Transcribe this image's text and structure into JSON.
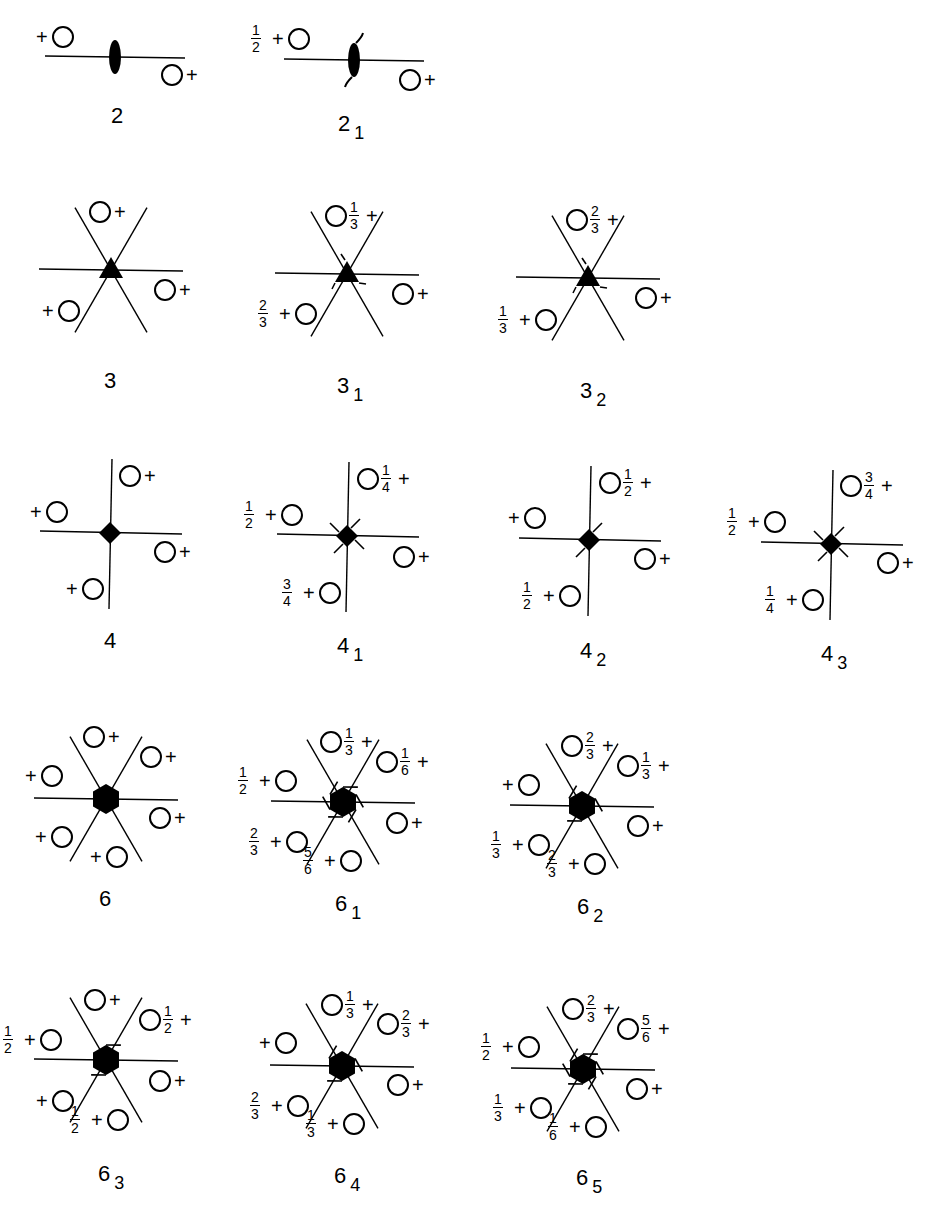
{
  "figure": {
    "panels": [
      {
        "id": "p2",
        "label": "2",
        "sub": "",
        "order": 2,
        "screw": 0,
        "cx": 115,
        "cy": 57,
        "type": "line",
        "positions": [
          {
            "x": 63,
            "y": 37,
            "frac": "",
            "plusSide": "left"
          },
          {
            "x": 172,
            "y": 75,
            "frac": "",
            "plusSide": "right"
          }
        ]
      },
      {
        "id": "p21",
        "label": "2",
        "sub": "1",
        "order": 2,
        "screw": 1,
        "cx": 354,
        "cy": 60,
        "type": "line",
        "positions": [
          {
            "x": 299,
            "y": 39,
            "frac": "1/2",
            "plusSide": "left"
          },
          {
            "x": 410,
            "y": 80,
            "frac": "",
            "plusSide": "right"
          }
        ]
      },
      {
        "id": "p3",
        "label": "3",
        "sub": "",
        "order": 3,
        "screw": 0,
        "cx": 111,
        "cy": 270,
        "positions": [
          {
            "x": 100,
            "y": 212,
            "frac": "",
            "plusSide": "right"
          },
          {
            "x": 165,
            "y": 290,
            "frac": "",
            "plusSide": "right"
          },
          {
            "x": 69,
            "y": 311,
            "frac": "",
            "plusSide": "left"
          }
        ]
      },
      {
        "id": "p31",
        "label": "3",
        "sub": "1",
        "order": 3,
        "screw": 1,
        "cx": 347,
        "cy": 274,
        "positions": [
          {
            "x": 336,
            "y": 216,
            "frac": "1/3",
            "plusSide": "right"
          },
          {
            "x": 403,
            "y": 294,
            "frac": "",
            "plusSide": "right"
          },
          {
            "x": 306,
            "y": 314,
            "frac": "2/3",
            "plusSide": "left"
          }
        ]
      },
      {
        "id": "p32",
        "label": "3",
        "sub": "2",
        "order": 3,
        "screw": 2,
        "cx": 588,
        "cy": 278,
        "positions": [
          {
            "x": 577,
            "y": 220,
            "frac": "2/3",
            "plusSide": "right"
          },
          {
            "x": 646,
            "y": 298,
            "frac": "",
            "plusSide": "right"
          },
          {
            "x": 546,
            "y": 320,
            "frac": "1/3",
            "plusSide": "left"
          }
        ]
      },
      {
        "id": "p4",
        "label": "4",
        "sub": "",
        "order": 4,
        "screw": 0,
        "cx": 110,
        "cy": 533,
        "positions": [
          {
            "x": 130,
            "y": 476,
            "frac": "",
            "plusSide": "right"
          },
          {
            "x": 57,
            "y": 512,
            "frac": "",
            "plusSide": "left"
          },
          {
            "x": 165,
            "y": 552,
            "frac": "",
            "plusSide": "right"
          },
          {
            "x": 93,
            "y": 589,
            "frac": "",
            "plusSide": "left"
          }
        ]
      },
      {
        "id": "p41",
        "label": "4",
        "sub": "1",
        "order": 4,
        "screw": 1,
        "cx": 347,
        "cy": 536,
        "positions": [
          {
            "x": 368,
            "y": 479,
            "frac": "1/4",
            "plusSide": "right"
          },
          {
            "x": 292,
            "y": 515,
            "frac": "1/2",
            "plusSide": "left"
          },
          {
            "x": 404,
            "y": 557,
            "frac": "",
            "plusSide": "right"
          },
          {
            "x": 330,
            "y": 593,
            "frac": "3/4",
            "plusSide": "left"
          }
        ]
      },
      {
        "id": "p42",
        "label": "4",
        "sub": "2",
        "order": 4,
        "screw": 2,
        "cx": 589,
        "cy": 540,
        "positions": [
          {
            "x": 610,
            "y": 483,
            "frac": "1/2",
            "plusSide": "right"
          },
          {
            "x": 535,
            "y": 518,
            "frac": "",
            "plusSide": "left"
          },
          {
            "x": 645,
            "y": 559,
            "frac": "",
            "plusSide": "right"
          },
          {
            "x": 570,
            "y": 596,
            "frac": "1/2",
            "plusSide": "left"
          }
        ]
      },
      {
        "id": "p43",
        "label": "4",
        "sub": "3",
        "order": 4,
        "screw": 3,
        "cx": 831,
        "cy": 544,
        "positions": [
          {
            "x": 851,
            "y": 486,
            "frac": "3/4",
            "plusSide": "right"
          },
          {
            "x": 775,
            "y": 522,
            "frac": "1/2",
            "plusSide": "left"
          },
          {
            "x": 888,
            "y": 563,
            "frac": "",
            "plusSide": "right"
          },
          {
            "x": 813,
            "y": 600,
            "frac": "1/4",
            "plusSide": "left"
          }
        ]
      },
      {
        "id": "p6",
        "label": "6",
        "sub": "",
        "order": 6,
        "screw": 0,
        "cx": 106,
        "cy": 799,
        "positions": [
          {
            "x": 94,
            "y": 737,
            "frac": "",
            "plusSide": "right"
          },
          {
            "x": 151,
            "y": 757,
            "frac": "",
            "plusSide": "right"
          },
          {
            "x": 52,
            "y": 776,
            "frac": "",
            "plusSide": "left"
          },
          {
            "x": 160,
            "y": 818,
            "frac": "",
            "plusSide": "right"
          },
          {
            "x": 62,
            "y": 837,
            "frac": "",
            "plusSide": "left"
          },
          {
            "x": 117,
            "y": 857,
            "frac": "",
            "plusSide": "left"
          }
        ]
      },
      {
        "id": "p61",
        "label": "6",
        "sub": "1",
        "order": 6,
        "screw": 1,
        "cx": 343,
        "cy": 802,
        "positions": [
          {
            "x": 331,
            "y": 742,
            "frac": "1/3",
            "plusSide": "right"
          },
          {
            "x": 387,
            "y": 762,
            "frac": "1/6",
            "plusSide": "right"
          },
          {
            "x": 286,
            "y": 781,
            "frac": "1/2",
            "plusSide": "left"
          },
          {
            "x": 397,
            "y": 823,
            "frac": "",
            "plusSide": "right"
          },
          {
            "x": 297,
            "y": 842,
            "frac": "2/3",
            "plusSide": "left"
          },
          {
            "x": 351,
            "y": 861,
            "frac": "5/6",
            "plusSide": "left"
          }
        ]
      },
      {
        "id": "p62",
        "label": "6",
        "sub": "2",
        "order": 6,
        "screw": 2,
        "cx": 582,
        "cy": 806,
        "positions": [
          {
            "x": 572,
            "y": 746,
            "frac": "2/3",
            "plusSide": "right"
          },
          {
            "x": 628,
            "y": 766,
            "frac": "1/3",
            "plusSide": "right"
          },
          {
            "x": 529,
            "y": 785,
            "frac": "",
            "plusSide": "left"
          },
          {
            "x": 638,
            "y": 826,
            "frac": "",
            "plusSide": "right"
          },
          {
            "x": 539,
            "y": 845,
            "frac": "1/3",
            "plusSide": "left"
          },
          {
            "x": 595,
            "y": 864,
            "frac": "2/3",
            "plusSide": "left"
          }
        ]
      },
      {
        "id": "p63",
        "label": "6",
        "sub": "3",
        "order": 6,
        "screw": 3,
        "cx": 106,
        "cy": 1060,
        "positions": [
          {
            "x": 95,
            "y": 1000,
            "frac": "",
            "plusSide": "right"
          },
          {
            "x": 150,
            "y": 1020,
            "frac": "1/2",
            "plusSide": "right"
          },
          {
            "x": 51,
            "y": 1040,
            "frac": "1/2",
            "plusSide": "left"
          },
          {
            "x": 160,
            "y": 1081,
            "frac": "",
            "plusSide": "right"
          },
          {
            "x": 63,
            "y": 1101,
            "frac": "",
            "plusSide": "left"
          },
          {
            "x": 118,
            "y": 1120,
            "frac": "1/2",
            "plusSide": "left"
          }
        ]
      },
      {
        "id": "p64",
        "label": "6",
        "sub": "4",
        "order": 6,
        "screw": 4,
        "cx": 342,
        "cy": 1066,
        "positions": [
          {
            "x": 332,
            "y": 1005,
            "frac": "1/3",
            "plusSide": "right"
          },
          {
            "x": 388,
            "y": 1024,
            "frac": "2/3",
            "plusSide": "right"
          },
          {
            "x": 286,
            "y": 1043,
            "frac": "",
            "plusSide": "left"
          },
          {
            "x": 398,
            "y": 1085,
            "frac": "",
            "plusSide": "right"
          },
          {
            "x": 298,
            "y": 1106,
            "frac": "2/3",
            "plusSide": "left"
          },
          {
            "x": 354,
            "y": 1124,
            "frac": "1/3",
            "plusSide": "left"
          }
        ]
      },
      {
        "id": "p65",
        "label": "6",
        "sub": "5",
        "order": 6,
        "screw": 5,
        "cx": 583,
        "cy": 1069,
        "positions": [
          {
            "x": 573,
            "y": 1009,
            "frac": "2/3",
            "plusSide": "right"
          },
          {
            "x": 628,
            "y": 1029,
            "frac": "5/6",
            "plusSide": "right"
          },
          {
            "x": 529,
            "y": 1047,
            "frac": "1/2",
            "plusSide": "left"
          },
          {
            "x": 637,
            "y": 1089,
            "frac": "",
            "plusSide": "right"
          },
          {
            "x": 541,
            "y": 1108,
            "frac": "1/3",
            "plusSide": "left"
          },
          {
            "x": 596,
            "y": 1127,
            "frac": "1/6",
            "plusSide": "left"
          }
        ]
      }
    ],
    "labels": [
      {
        "panel": "p2",
        "text": "2",
        "sub": "",
        "x": 111,
        "y": 105
      },
      {
        "panel": "p21",
        "text": "2",
        "sub": "1",
        "x": 338,
        "y": 113
      },
      {
        "panel": "p3",
        "text": "3",
        "sub": "",
        "x": 104,
        "y": 370
      },
      {
        "panel": "p31",
        "text": "3",
        "sub": "1",
        "x": 337,
        "y": 375
      },
      {
        "panel": "p32",
        "text": "3",
        "sub": "2",
        "x": 580,
        "y": 380
      },
      {
        "panel": "p4",
        "text": "4",
        "sub": "",
        "x": 104,
        "y": 630
      },
      {
        "panel": "p41",
        "text": "4",
        "sub": "1",
        "x": 337,
        "y": 635
      },
      {
        "panel": "p42",
        "text": "4",
        "sub": "2",
        "x": 580,
        "y": 640
      },
      {
        "panel": "p43",
        "text": "4",
        "sub": "3",
        "x": 821,
        "y": 643
      },
      {
        "panel": "p6",
        "text": "6",
        "sub": "",
        "x": 99,
        "y": 888
      },
      {
        "panel": "p61",
        "text": "6",
        "sub": "1",
        "x": 335,
        "y": 893
      },
      {
        "panel": "p62",
        "text": "6",
        "sub": "2",
        "x": 577,
        "y": 896
      },
      {
        "panel": "p63",
        "text": "6",
        "sub": "3",
        "x": 98,
        "y": 1163
      },
      {
        "panel": "p64",
        "text": "6",
        "sub": "4",
        "x": 334,
        "y": 1165
      },
      {
        "panel": "p65",
        "text": "6",
        "sub": "5",
        "x": 576,
        "y": 1167
      }
    ]
  }
}
